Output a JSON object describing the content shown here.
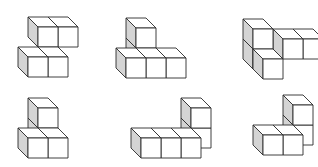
{
  "diagram": {
    "type": "isometric-cube-figures",
    "layout": {
      "rows": 2,
      "cols": 3
    },
    "colors": {
      "background": "#ffffff",
      "outline": "#2a2a2a",
      "front_face": "#ffffff",
      "top_face": "#ffffff",
      "left_side_face": "#d4d4d4"
    },
    "cube_size": 20,
    "depth_offset": 10,
    "figures": [
      {
        "id": "figure-1",
        "origin": [
          28,
          77
        ],
        "cube_count": 4,
        "cubes": [
          [
            0,
            0,
            0
          ],
          [
            1,
            0,
            0
          ],
          [
            0,
            1,
            1
          ],
          [
            1,
            1,
            1
          ]
        ]
      },
      {
        "id": "figure-2",
        "origin": [
          126,
          78
        ],
        "cube_count": 6,
        "cubes": [
          [
            0,
            0,
            1
          ],
          [
            0,
            1,
            1
          ],
          [
            0,
            0,
            0
          ],
          [
            1,
            0,
            0
          ],
          [
            2,
            0,
            0
          ]
        ]
      },
      {
        "id": "figure-3",
        "origin": [
          243,
          79
        ],
        "cube_count": 5,
        "cubes": [
          [
            0,
            0,
            1
          ],
          [
            0,
            1,
            1
          ],
          [
            1,
            0,
            2
          ],
          [
            2,
            0,
            2
          ],
          [
            1,
            0,
            0
          ]
        ]
      },
      {
        "id": "figure-4",
        "origin": [
          28,
          158
        ],
        "cube_count": 5,
        "cubes": [
          [
            0,
            0,
            1
          ],
          [
            0,
            1,
            1
          ],
          [
            0,
            0,
            0
          ],
          [
            1,
            0,
            0
          ]
        ]
      },
      {
        "id": "figure-5",
        "origin": [
          141,
          158
        ],
        "cube_count": 5,
        "cubes": [
          [
            2,
            1,
            1
          ],
          [
            2,
            0,
            1
          ],
          [
            0,
            0,
            0
          ],
          [
            1,
            0,
            0
          ],
          [
            2,
            0,
            0
          ]
        ]
      },
      {
        "id": "figure-6",
        "origin": [
          263,
          155
        ],
        "cube_count": 4,
        "cubes": [
          [
            1,
            1,
            1
          ],
          [
            1,
            0,
            1
          ],
          [
            0,
            0,
            0
          ],
          [
            1,
            0,
            0
          ]
        ]
      }
    ]
  }
}
